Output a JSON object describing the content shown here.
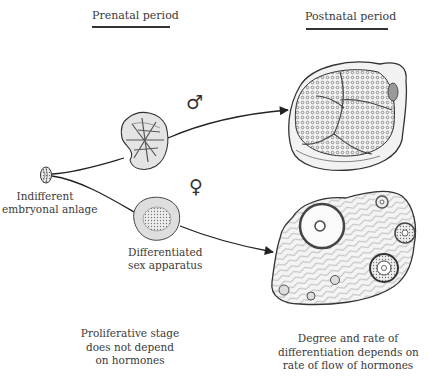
{
  "headers": {
    "prenatal": "Prenatal period",
    "postnatal": "Postnatal period"
  },
  "labels": {
    "indifferent_line1": "Indifferent",
    "indifferent_line2": "embryonal anlage",
    "differentiated_line1": "Differentiated",
    "differentiated_line2": "sex apparatus"
  },
  "symbols": {
    "male": "♂",
    "female": "♀"
  },
  "footer": {
    "left": [
      "Proliferative stage",
      "does not depend",
      "on hormones"
    ],
    "right": [
      "Degree and rate of",
      "differentiation depends on",
      "rate of flow of hormones"
    ]
  },
  "colors": {
    "ink": "#333333",
    "tissue_light": "#e6e6e6",
    "tissue_mid": "#bdbdbd",
    "background": "#ffffff"
  }
}
